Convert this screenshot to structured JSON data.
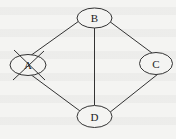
{
  "diagram": {
    "type": "undirected-graph",
    "colors": {
      "stroke": "#333333",
      "background": "#f4f4f2",
      "label": "#222222"
    },
    "nodes": [
      {
        "id": "A",
        "label": "A",
        "crossed_out": true
      },
      {
        "id": "B",
        "label": "B",
        "crossed_out": false
      },
      {
        "id": "C",
        "label": "C",
        "crossed_out": false
      },
      {
        "id": "D",
        "label": "D",
        "crossed_out": false
      }
    ],
    "edges": [
      {
        "from": "A",
        "to": "B"
      },
      {
        "from": "A",
        "to": "D"
      },
      {
        "from": "B",
        "to": "C"
      },
      {
        "from": "B",
        "to": "D"
      },
      {
        "from": "C",
        "to": "D"
      }
    ]
  }
}
